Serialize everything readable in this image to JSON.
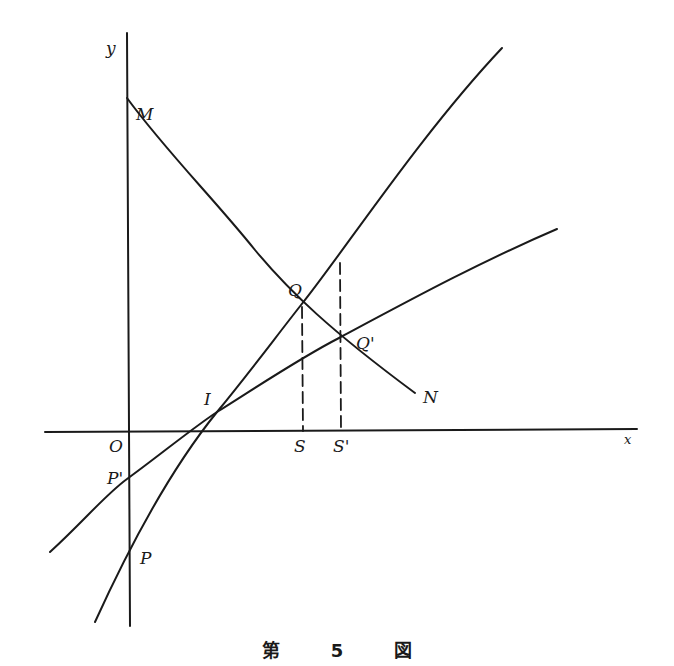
{
  "figure": {
    "caption": {
      "prefix": "第",
      "number": "5",
      "suffix": "図"
    },
    "axes": {
      "x_label": "x",
      "y_label": "y",
      "origin_label": "O"
    },
    "points": {
      "M": "M",
      "N": "N",
      "Q": "Q",
      "Q_prime": "Q'",
      "I": "I",
      "P": "P",
      "P_prime": "P'",
      "S": "S",
      "S_prime": "S'"
    },
    "curves": [
      {
        "name": "MN",
        "description": "downward sloping curve from M through Q and Q' to N"
      },
      {
        "name": "PQ",
        "description": "steep upward curve from below P through I and Q"
      },
      {
        "name": "P'Q'",
        "description": "flatter upward curve through P', I and Q'"
      }
    ],
    "dashed_lines": [
      {
        "name": "QS",
        "description": "vertical dashed line from Q to S"
      },
      {
        "name": "Q'S'",
        "description": "vertical dashed line from upper curve to S' through Q'"
      }
    ],
    "colors": {
      "ink": "#1a1a1a",
      "background": "#ffffff"
    }
  }
}
